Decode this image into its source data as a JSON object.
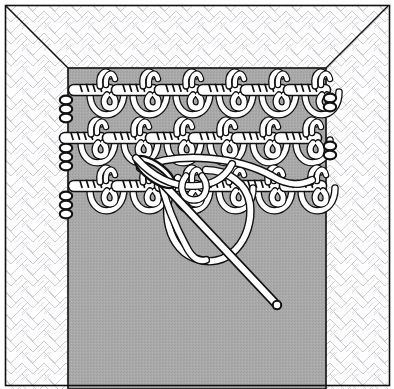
{
  "figure": {
    "domain": "diagram",
    "title": "Crochet edging worked along the edge of a knitted fabric with a yarn needle",
    "subject": "needlework-instruction-diagram",
    "style": "black-and-white line illustration",
    "canvas": {
      "width": 394,
      "height": 389
    }
  },
  "colors": {
    "page_background": "#ffffff",
    "fabric_fill": "#a9a9a9",
    "fabric_outline": "#1a1a1a",
    "texture_background": "#fdfdfd",
    "texture_stroke": "#c9c9cf",
    "yarn_fill": "#ffffff",
    "yarn_outline": "#111111",
    "needle_fill": "#ffffff",
    "needle_outline": "#111111",
    "frame_border": "#111111",
    "shadow_gray": "#8d8d8d"
  },
  "frame": {
    "name": "illustration-border",
    "inset_left": 5,
    "inset_top": 5,
    "inset_right": 389,
    "inset_bottom": 385,
    "stroke_width": 1.6
  },
  "background": {
    "name": "herringbone-texture",
    "pattern": "herringbone-weave",
    "tile_size": 22,
    "stroke_width": 0.9
  },
  "fabric_panel": {
    "name": "knitted-fabric-panel",
    "x": 68,
    "y": 68,
    "width": 258,
    "height": 317,
    "fill": "#a9a9a9",
    "description": "grey rectangle representing the knitted fabric, extends below the lower frame edge"
  },
  "perspective_lines": [
    {
      "name": "corner-line-top-left",
      "from": [
        6,
        6
      ],
      "to": [
        68,
        68
      ]
    },
    {
      "name": "corner-line-top-right",
      "from": [
        388,
        6
      ],
      "to": [
        326,
        68
      ]
    }
  ],
  "crochet_rows": [
    {
      "name": "stitch-row-1",
      "index": 1,
      "baseline_y": 88,
      "repeats": 6,
      "repeat_width": 43,
      "first_center_x": 88,
      "description": "top row of chain clusters with upright picot and large hanging loop"
    },
    {
      "name": "stitch-row-2",
      "index": 2,
      "baseline_y": 136,
      "repeats": 6,
      "repeat_width": 43,
      "first_center_x": 79,
      "description": "second row of chain clusters offset half a repeat, each with a hanging loop"
    },
    {
      "name": "stitch-row-3",
      "index": 3,
      "baseline_y": 184,
      "repeats": 6,
      "repeat_width": 43,
      "first_center_x": 88,
      "description": "third, in-progress row — the working loop is being drawn through at the fourth cluster"
    }
  ],
  "side_chain": {
    "name": "left-edge-chain",
    "x": 66,
    "segments": 3,
    "description": "column of small chain beads running down the left selvedge"
  },
  "needle": {
    "name": "yarn-needle",
    "eye": {
      "cx": 155,
      "cy": 172,
      "rx": 21,
      "ry": 8,
      "rotation_deg": 28
    },
    "shaft": {
      "from": [
        150,
        170
      ],
      "to": [
        277,
        305
      ],
      "width": 7
    },
    "tip": [
      277,
      305
    ],
    "description": "blunt yarn needle with an elongated eye, passing under the working loop"
  },
  "working_loop": {
    "name": "working-yarn-loop",
    "cx": 212,
    "cy": 212,
    "rx": 37,
    "ry": 44,
    "description": "large loop of yarn drawn out by the needle in front of the fabric"
  },
  "yarn_strands": [
    {
      "name": "yarn-strand-through-eye",
      "description": "strand threaded through the needle eye and running right across the row"
    },
    {
      "name": "yarn-strand-working",
      "description": "working strand leading from the last completed stitch to the needle"
    }
  ]
}
